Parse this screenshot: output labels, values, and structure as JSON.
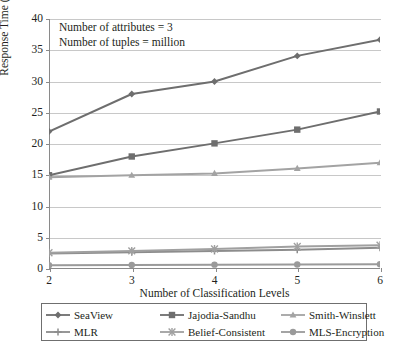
{
  "chart_data": {
    "type": "line",
    "title": "",
    "xlabel": "Number of Classification Levels",
    "ylabel": "Response Time (minutes)",
    "x": [
      2,
      3,
      4,
      5,
      6
    ],
    "xtick_labels": [
      "2",
      "3",
      "4",
      "5",
      "6"
    ],
    "ytick_labels": [
      "0",
      "5",
      "10",
      "15",
      "20",
      "25",
      "30",
      "35",
      "40"
    ],
    "yticks": [
      0,
      5,
      10,
      15,
      20,
      25,
      30,
      35,
      40
    ],
    "ylim": [
      0,
      40
    ],
    "xlim": [
      2,
      6
    ],
    "grid": "horizontal",
    "legend_position": "bottom",
    "legend_columns": 3,
    "annotations": [
      "Number of attributes = 3",
      "Number of tuples = million"
    ],
    "series": [
      {
        "name": "SeaView",
        "marker": "diamond",
        "color": "#6e6e6e",
        "values": [
          22.0,
          28.0,
          30.0,
          34.1,
          36.7
        ]
      },
      {
        "name": "Jajodia-Sandhu",
        "marker": "square",
        "color": "#6e6e6e",
        "values": [
          15.0,
          18.0,
          20.1,
          22.3,
          25.2
        ]
      },
      {
        "name": "Smith-Winslett",
        "marker": "triangle",
        "color": "#a3a3a3",
        "values": [
          14.7,
          15.0,
          15.3,
          16.1,
          17.0
        ]
      },
      {
        "name": "MLR",
        "marker": "plus",
        "color": "#8c8c8c",
        "values": [
          2.5,
          2.7,
          2.9,
          3.1,
          3.4
        ]
      },
      {
        "name": "Belief-Consistent",
        "marker": "asterisk",
        "color": "#a0a0a0",
        "values": [
          2.6,
          2.9,
          3.2,
          3.6,
          3.8
        ]
      },
      {
        "name": "MLS-Encryption",
        "marker": "circle",
        "color": "#9a9a9a",
        "values": [
          0.6,
          0.65,
          0.7,
          0.72,
          0.75
        ]
      }
    ]
  },
  "colors": {
    "axis": "#8a8a8a",
    "grid": "#c8c8c8",
    "text": "#231f20",
    "legend_border": "#6f6f6f"
  }
}
